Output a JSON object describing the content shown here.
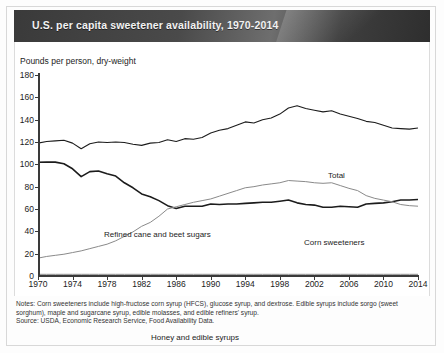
{
  "title": "U.S. per capita sweetener availability, 1970-2014",
  "axis": {
    "y_title": "Pounds per person, dry-weight",
    "y_ticks": [
      "0",
      "20",
      "40",
      "60",
      "80",
      "100",
      "120",
      "140",
      "160",
      "180"
    ],
    "x_ticks": [
      "1970",
      "1974",
      "1978",
      "1982",
      "1986",
      "1990",
      "1994",
      "1998",
      "2002",
      "2006",
      "2010",
      "2014"
    ]
  },
  "series_labels": {
    "total": "Total",
    "refined": "Refined cane and beet sugars",
    "corn": "Corn sweeteners",
    "honey": "Honey and edible syrups"
  },
  "notes": {
    "line1": "Notes: Corn sweeteners include high-fructose corn syrup (HFCS), glucose syrup, and dextrose. Edible syrups include sorgo (sweet sorghum), maple and sugarcane syrup, edible molasses, and edible refiners' syrup.",
    "source": "Source: USDA, Economic Research Service, Food Availability Data."
  },
  "colors": {
    "banner_dark": "#3a3a3a",
    "line_dark": "#1c1c1c",
    "line_light": "#8a8a8a",
    "axis": "#3a3a3a"
  },
  "chart_data": {
    "type": "line",
    "title": "U.S. per capita sweetener availability, 1970-2014",
    "xlabel": "",
    "ylabel": "Pounds per person, dry-weight",
    "xlim": [
      1970,
      2014
    ],
    "ylim": [
      0,
      180
    ],
    "grid": false,
    "legend": "inline-annotations",
    "x": [
      1970,
      1971,
      1972,
      1973,
      1974,
      1975,
      1976,
      1977,
      1978,
      1979,
      1980,
      1981,
      1982,
      1983,
      1984,
      1985,
      1986,
      1987,
      1988,
      1989,
      1990,
      1991,
      1992,
      1993,
      1994,
      1995,
      1996,
      1997,
      1998,
      1999,
      2000,
      2001,
      2002,
      2003,
      2004,
      2005,
      2006,
      2007,
      2008,
      2009,
      2010,
      2011,
      2012,
      2013,
      2014
    ],
    "series": [
      {
        "name": "Total",
        "values": [
          119.0,
          120.5,
          121.0,
          121.5,
          119.0,
          114.0,
          118.5,
          120.0,
          119.5,
          120.0,
          119.5,
          118.0,
          117.0,
          119.0,
          119.5,
          122.0,
          120.5,
          123.0,
          122.5,
          124.0,
          128.0,
          130.5,
          132.0,
          135.0,
          138.0,
          137.0,
          140.0,
          141.5,
          145.0,
          150.5,
          152.5,
          150.0,
          148.5,
          147.0,
          148.0,
          145.0,
          143.0,
          141.0,
          138.5,
          137.5,
          135.0,
          132.5,
          132.0,
          131.5,
          132.5
        ]
      },
      {
        "name": "Refined cane and beet sugars",
        "values": [
          101.8,
          102.0,
          102.0,
          100.5,
          96.0,
          89.0,
          93.5,
          94.0,
          91.5,
          89.5,
          83.5,
          79.0,
          73.5,
          71.0,
          67.5,
          63.0,
          60.5,
          62.5,
          62.5,
          62.5,
          64.5,
          64.0,
          64.5,
          64.5,
          65.0,
          65.5,
          66.0,
          66.0,
          67.0,
          68.0,
          65.5,
          64.0,
          63.5,
          61.5,
          61.5,
          62.5,
          62.0,
          61.5,
          64.5,
          65.0,
          65.5,
          66.5,
          68.0,
          68.0,
          68.5
        ]
      },
      {
        "name": "Corn sweeteners",
        "values": [
          16.0,
          17.5,
          18.5,
          19.5,
          21.0,
          22.5,
          24.5,
          26.5,
          28.5,
          31.5,
          35.5,
          39.5,
          44.5,
          48.0,
          53.5,
          60.0,
          62.0,
          64.0,
          66.0,
          67.5,
          69.0,
          71.5,
          74.0,
          76.5,
          79.0,
          80.0,
          81.5,
          82.5,
          83.5,
          85.5,
          85.0,
          84.5,
          83.5,
          83.0,
          83.5,
          81.0,
          78.5,
          76.5,
          72.0,
          69.5,
          68.0,
          66.5,
          64.0,
          63.0,
          62.5
        ]
      },
      {
        "name": "Honey and edible syrups",
        "values": [
          1.5,
          1.5,
          1.5,
          1.5,
          1.5,
          1.5,
          1.5,
          1.5,
          1.5,
          1.5,
          1.5,
          1.5,
          1.5,
          1.5,
          1.5,
          1.5,
          1.5,
          1.5,
          1.5,
          1.5,
          1.5,
          1.5,
          1.5,
          1.5,
          1.5,
          1.5,
          1.5,
          1.5,
          1.5,
          1.5,
          1.5,
          1.5,
          1.5,
          1.5,
          1.5,
          1.5,
          1.5,
          1.5,
          1.5,
          1.5,
          1.5,
          1.5,
          1.5,
          1.5,
          1.5
        ]
      }
    ]
  }
}
